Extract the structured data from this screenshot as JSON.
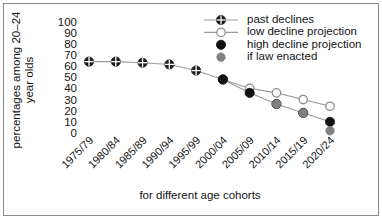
{
  "chart_data": {
    "type": "line",
    "title": "",
    "subtitle": "",
    "xlabel": "for different age cohorts",
    "ylabel": "percentages among 20–24 year olds",
    "ylabel_lines": [
      "percentages among 20–24",
      "year olds"
    ],
    "categories": [
      "1975/79",
      "1980/84",
      "1985/89",
      "1990/94",
      "1995/99",
      "2000/04",
      "2005/09",
      "2010/14",
      "2015/19",
      "2020/24"
    ],
    "ylim": [
      0,
      100
    ],
    "yticks": [
      100,
      90,
      80,
      70,
      60,
      50,
      40,
      30,
      20,
      10,
      0
    ],
    "grid": false,
    "legend_position": "top-right",
    "series": [
      {
        "name": "past declines",
        "marker": "crossed-circle",
        "color": "#1c1c1c",
        "line_color": "#9a9a9a",
        "has_line": true,
        "values": [
          64,
          64,
          63,
          61.5,
          56,
          48,
          null,
          null,
          null,
          null
        ]
      },
      {
        "name": "low decline projection",
        "marker": "hollow-circle",
        "color": "#ffffff",
        "line_color": "#9a9a9a",
        "has_line": true,
        "values": [
          null,
          null,
          null,
          null,
          null,
          48,
          40,
          36,
          30,
          24
        ]
      },
      {
        "name": "high decline projection",
        "marker": "filled-circle",
        "color": "#111111",
        "line_color": "#9a9a9a",
        "has_line": true,
        "values": [
          null,
          null,
          null,
          null,
          null,
          48,
          36,
          26,
          18,
          10
        ]
      },
      {
        "name": "if law enacted",
        "marker": "gray-circle",
        "color": "#808080",
        "line_color": "#9a9a9a",
        "has_line": false,
        "values": [
          null,
          null,
          null,
          null,
          null,
          null,
          null,
          26,
          18,
          2
        ]
      }
    ]
  },
  "legend": {
    "items": [
      {
        "label": "past declines",
        "marker": "crossed-circle",
        "line": true
      },
      {
        "label": "low decline projection",
        "marker": "hollow-circle",
        "line": true
      },
      {
        "label": "high decline projection",
        "marker": "filled-circle",
        "line": false
      },
      {
        "label": "if law enacted",
        "marker": "gray-circle",
        "line": false
      }
    ]
  },
  "colors": {
    "frame": "#8a8a8a",
    "line": "#9a9a9a",
    "dark_marker": "#1c1c1c",
    "gray_marker": "#808080",
    "text": "#141414",
    "background": "#ffffff"
  },
  "axis": {
    "y_ticks": [
      "100",
      "90",
      "80",
      "70",
      "60",
      "50",
      "40",
      "30",
      "20",
      "10",
      "0"
    ],
    "x_ticks": [
      "1975/79",
      "1980/84",
      "1985/89",
      "1990/94",
      "1995/99",
      "2000/04",
      "2005/09",
      "2010/14",
      "2015/19",
      "2020/24"
    ],
    "x_title": "for different age cohorts",
    "y_title_line1": "percentages among 20–24",
    "y_title_line2": "year olds"
  }
}
